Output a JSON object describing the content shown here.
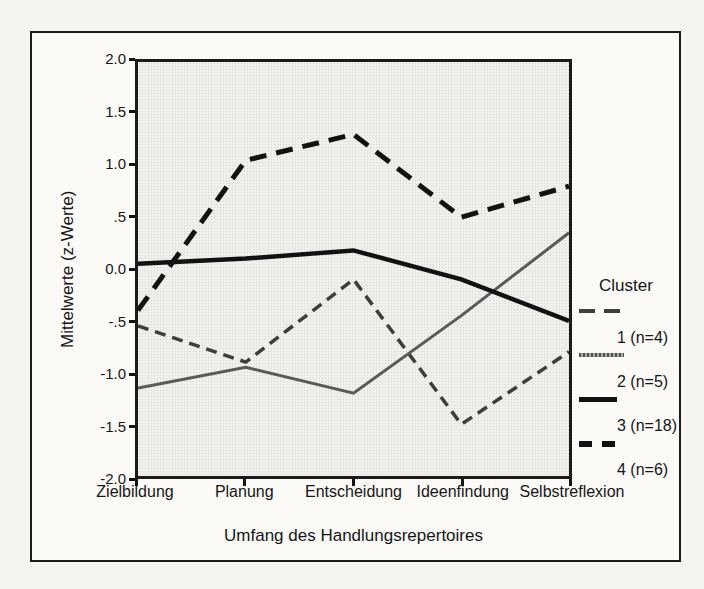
{
  "figure": {
    "y_axis": {
      "title": "Mittelwerte (z-Werte)",
      "tick_labels": [
        "2.0",
        "1.5",
        "1.0",
        ".5",
        "0.0",
        "-.5",
        "-1.0",
        "-1.5",
        "-2.0"
      ]
    },
    "x_axis": {
      "title": "Umfang des Handlungsrepertoires",
      "category_labels": [
        "Zielbildung",
        "Planung",
        "Entscheidung",
        "Ideenfindung",
        "Selbstreflexion"
      ]
    },
    "legend": {
      "title": "Cluster",
      "entries": [
        {
          "label": "1 (n=4)",
          "swatch": "dashed-thin-gray"
        },
        {
          "label": "2 (n=5)",
          "swatch": "hatched-gray"
        },
        {
          "label": "3 (n=18)",
          "swatch": "solid-thick-black"
        },
        {
          "label": "4 (n=6)",
          "swatch": "dashed-thick-black"
        }
      ]
    }
  },
  "chart_data": {
    "type": "line",
    "title": "",
    "categories": [
      "Zielbildung",
      "Planung",
      "Entscheidung",
      "Ideenfindung",
      "Selbstreflexion"
    ],
    "series": [
      {
        "name": "Cluster 1 (n=4)",
        "values": [
          -0.55,
          -0.9,
          -0.1,
          -1.5,
          -0.8
        ],
        "line_style": "dashed",
        "color": "#3d3d3d",
        "width": 3.5,
        "dash": "11 7"
      },
      {
        "name": "Cluster 2 (n=5)",
        "values": [
          -1.15,
          -0.95,
          -1.2,
          -0.45,
          0.35
        ],
        "line_style": "solid",
        "color": "#595959",
        "width": 3,
        "dash": ""
      },
      {
        "name": "Cluster 3 (n=18)",
        "values": [
          0.05,
          0.1,
          0.18,
          -0.1,
          -0.5
        ],
        "line_style": "solid",
        "color": "#121212",
        "width": 4.5,
        "dash": ""
      },
      {
        "name": "Cluster 4 (n=6)",
        "values": [
          -0.4,
          1.05,
          1.3,
          0.5,
          0.8
        ],
        "line_style": "dashed",
        "color": "#121212",
        "width": 5,
        "dash": "17 10"
      }
    ],
    "xlabel": "Umfang des Handlungsrepertoires",
    "ylabel": "Mittelwerte (z-Werte)",
    "ylim": [
      -2.0,
      2.0
    ],
    "ytick_step": 0.5,
    "grid": false,
    "legend_title": "Cluster",
    "legend_position": "right",
    "plot_background": "light-gray-halftone",
    "colors": {
      "frame_border": "#1c1c1c",
      "plot_bg": "#f0efec",
      "page_bg": "#f5f4f0"
    }
  }
}
